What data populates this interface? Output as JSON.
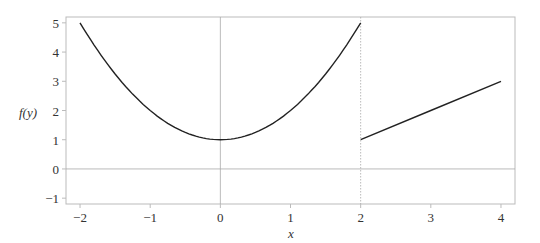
{
  "chart_data": {
    "type": "line",
    "title": "",
    "xlabel": "x",
    "ylabel": "f(y)",
    "xlim": [
      -2.2,
      4.2
    ],
    "ylim": [
      -1.2,
      5.2
    ],
    "x_ticks": [
      -2,
      -1,
      0,
      1,
      2,
      3,
      4
    ],
    "x_tick_labels": [
      "−2",
      "−1",
      "0",
      "1",
      "2",
      "3",
      "4"
    ],
    "y_ticks": [
      -1,
      0,
      1,
      2,
      3,
      4,
      5
    ],
    "y_tick_labels": [
      "−1",
      "0",
      "1",
      "2",
      "3",
      "4",
      "5"
    ],
    "grid": false,
    "reference_lines": [
      {
        "orientation": "vertical",
        "value": 0,
        "style": "solid"
      },
      {
        "orientation": "horizontal",
        "value": 0,
        "style": "solid"
      },
      {
        "orientation": "vertical",
        "value": 2,
        "style": "dotted"
      }
    ],
    "series": [
      {
        "name": "piece-1",
        "formula": "x^2 + 1",
        "domain": [
          -2,
          2
        ],
        "x": [
          -2,
          -1.5,
          -1,
          -0.5,
          0,
          0.5,
          1,
          1.5,
          2
        ],
        "y": [
          5,
          3.25,
          2,
          1.25,
          1,
          1.25,
          2,
          3.25,
          5
        ]
      },
      {
        "name": "piece-2",
        "formula": "x - 1",
        "domain": [
          2,
          4
        ],
        "x": [
          2,
          3,
          4
        ],
        "y": [
          1,
          2,
          3
        ]
      }
    ]
  },
  "colors": {
    "curve": "#222222",
    "frame": "#bbbbbb",
    "reference": "#aaaaaa",
    "text": "#333333"
  }
}
